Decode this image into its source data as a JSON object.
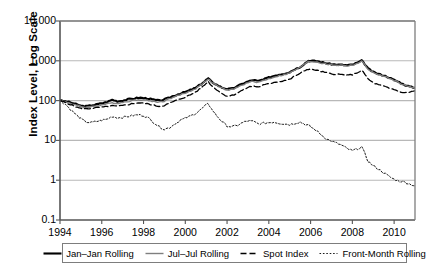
{
  "chart_data": {
    "type": "line",
    "title": "",
    "xlabel": "",
    "ylabel": "Index Level, Log Scale",
    "yscale": "log",
    "ylim": [
      0.1,
      10000
    ],
    "xlim": [
      1994,
      2011
    ],
    "grid": true,
    "legend_position": "bottom",
    "ytick_labels": [
      "10,000",
      "1,000",
      "100",
      "10",
      "1",
      "0.1"
    ],
    "ytick_values": [
      10000,
      1000,
      100,
      10,
      1,
      0.1
    ],
    "xtick_labels": [
      "1994",
      "1996",
      "1998",
      "2000",
      "2002",
      "2004",
      "2006",
      "2008",
      "2010"
    ],
    "xtick_values": [
      1994,
      1996,
      1998,
      2000,
      2002,
      2004,
      2006,
      2008,
      2010
    ],
    "series": [
      {
        "name": "Jan-Jan Rolling",
        "legend_label": "Jan–Jan Rolling",
        "style": "solid",
        "color": "#000000",
        "width": 2.1,
        "x": [
          1994.0,
          1994.25,
          1994.5,
          1994.75,
          1995.0,
          1995.25,
          1995.5,
          1995.75,
          1996.0,
          1996.25,
          1996.5,
          1996.75,
          1997.0,
          1997.25,
          1997.5,
          1997.75,
          1998.0,
          1998.25,
          1998.5,
          1998.75,
          1999.0,
          1999.25,
          1999.5,
          1999.75,
          2000.0,
          2000.25,
          2000.5,
          2000.75,
          2001.0,
          2001.1,
          2001.25,
          2001.5,
          2001.75,
          2002.0,
          2002.25,
          2002.5,
          2002.75,
          2003.0,
          2003.25,
          2003.5,
          2003.75,
          2004.0,
          2004.25,
          2004.5,
          2004.75,
          2005.0,
          2005.25,
          2005.5,
          2005.75,
          2005.9,
          2006.0,
          2006.25,
          2006.5,
          2006.75,
          2007.0,
          2007.25,
          2007.5,
          2007.75,
          2008.0,
          2008.25,
          2008.45,
          2008.6,
          2008.75,
          2009.0,
          2009.25,
          2009.5,
          2009.75,
          2010.0,
          2010.25,
          2010.5,
          2010.75,
          2011.0
        ],
        "y": [
          100,
          96,
          90,
          82,
          74,
          72,
          76,
          80,
          86,
          92,
          105,
          96,
          100,
          108,
          112,
          118,
          116,
          112,
          105,
          100,
          106,
          120,
          135,
          150,
          165,
          185,
          210,
          260,
          330,
          360,
          300,
          250,
          215,
          195,
          200,
          230,
          270,
          300,
          330,
          310,
          340,
          380,
          420,
          450,
          480,
          520,
          620,
          700,
          880,
          1000,
          990,
          990,
          930,
          870,
          820,
          800,
          790,
          770,
          800,
          900,
          1010,
          820,
          640,
          520,
          470,
          430,
          380,
          330,
          290,
          250,
          225,
          210
        ]
      },
      {
        "name": "Jul-Jul Rolling",
        "legend_label": "Jul–Jul Rolling",
        "style": "solid",
        "color": "#7f7f7f",
        "width": 1.4,
        "x": [
          1994.0,
          1994.25,
          1994.5,
          1994.75,
          1995.0,
          1995.25,
          1995.5,
          1995.75,
          1996.0,
          1996.25,
          1996.5,
          1996.75,
          1997.0,
          1997.25,
          1997.5,
          1997.75,
          1998.0,
          1998.25,
          1998.5,
          1998.75,
          1999.0,
          1999.25,
          1999.5,
          1999.75,
          2000.0,
          2000.25,
          2000.5,
          2000.75,
          2001.0,
          2001.1,
          2001.25,
          2001.5,
          2001.75,
          2002.0,
          2002.25,
          2002.5,
          2002.75,
          2003.0,
          2003.25,
          2003.5,
          2003.75,
          2004.0,
          2004.25,
          2004.5,
          2004.75,
          2005.0,
          2005.25,
          2005.5,
          2005.75,
          2005.9,
          2006.0,
          2006.25,
          2006.5,
          2006.75,
          2007.0,
          2007.25,
          2007.5,
          2007.75,
          2008.0,
          2008.25,
          2008.45,
          2008.6,
          2008.75,
          2009.0,
          2009.25,
          2009.5,
          2009.75,
          2010.0,
          2010.25,
          2010.5,
          2010.75,
          2011.0
        ],
        "y": [
          100,
          94,
          86,
          78,
          70,
          68,
          70,
          74,
          78,
          82,
          88,
          86,
          90,
          96,
          100,
          106,
          104,
          100,
          95,
          92,
          98,
          112,
          126,
          140,
          155,
          175,
          200,
          250,
          320,
          350,
          290,
          240,
          205,
          185,
          190,
          215,
          250,
          280,
          305,
          290,
          320,
          355,
          390,
          420,
          450,
          490,
          590,
          680,
          860,
          980,
          950,
          950,
          880,
          830,
          790,
          780,
          770,
          750,
          780,
          870,
          970,
          790,
          620,
          500,
          450,
          410,
          365,
          320,
          280,
          245,
          220,
          205
        ]
      },
      {
        "name": "Spot Index",
        "legend_label": "Spot Index",
        "style": "dashed",
        "color": "#000000",
        "width": 1.3,
        "dash": "6,3",
        "x": [
          1994.0,
          1994.25,
          1994.5,
          1994.75,
          1995.0,
          1995.25,
          1995.5,
          1995.75,
          1996.0,
          1996.25,
          1996.5,
          1996.75,
          1997.0,
          1997.25,
          1997.5,
          1997.75,
          1998.0,
          1998.25,
          1998.5,
          1998.75,
          1999.0,
          1999.25,
          1999.5,
          1999.75,
          2000.0,
          2000.25,
          2000.5,
          2000.75,
          2001.0,
          2001.1,
          2001.25,
          2001.5,
          2001.75,
          2002.0,
          2002.25,
          2002.5,
          2002.75,
          2003.0,
          2003.25,
          2003.5,
          2003.75,
          2004.0,
          2004.25,
          2004.5,
          2004.75,
          2005.0,
          2005.25,
          2005.5,
          2005.75,
          2005.9,
          2006.0,
          2006.25,
          2006.5,
          2006.75,
          2007.0,
          2007.25,
          2007.5,
          2007.75,
          2008.0,
          2008.25,
          2008.45,
          2008.6,
          2008.75,
          2009.0,
          2009.25,
          2009.5,
          2009.75,
          2010.0,
          2010.25,
          2010.5,
          2010.75,
          2011.0
        ],
        "y": [
          100,
          90,
          80,
          70,
          63,
          62,
          64,
          66,
          68,
          70,
          74,
          72,
          75,
          80,
          84,
          88,
          86,
          82,
          76,
          72,
          76,
          86,
          98,
          110,
          122,
          140,
          165,
          205,
          270,
          300,
          240,
          190,
          150,
          130,
          135,
          155,
          185,
          215,
          235,
          220,
          245,
          265,
          290,
          300,
          320,
          340,
          420,
          480,
          580,
          620,
          600,
          590,
          540,
          500,
          470,
          460,
          450,
          430,
          450,
          510,
          570,
          460,
          350,
          280,
          250,
          230,
          205,
          190,
          170,
          155,
          165,
          175
        ]
      },
      {
        "name": "Front-Month Rolling",
        "legend_label": "Front-Month Rolling",
        "style": "dotted",
        "color": "#000000",
        "width": 0.9,
        "dash": "1.6,1.8",
        "x": [
          1994.0,
          1994.25,
          1994.5,
          1994.75,
          1995.0,
          1995.25,
          1995.5,
          1995.75,
          1996.0,
          1996.25,
          1996.5,
          1996.75,
          1997.0,
          1997.25,
          1997.5,
          1997.75,
          1998.0,
          1998.25,
          1998.5,
          1998.75,
          1999.0,
          1999.25,
          1999.5,
          1999.75,
          2000.0,
          2000.25,
          2000.5,
          2000.75,
          2001.0,
          2001.1,
          2001.25,
          2001.5,
          2001.75,
          2002.0,
          2002.25,
          2002.5,
          2002.75,
          2003.0,
          2003.25,
          2003.5,
          2003.75,
          2004.0,
          2004.25,
          2004.5,
          2004.75,
          2005.0,
          2005.25,
          2005.5,
          2005.75,
          2005.9,
          2006.0,
          2006.25,
          2006.5,
          2006.75,
          2007.0,
          2007.25,
          2007.5,
          2007.75,
          2008.0,
          2008.25,
          2008.45,
          2008.6,
          2008.75,
          2009.0,
          2009.25,
          2009.5,
          2009.75,
          2010.0,
          2010.25,
          2010.5,
          2010.75,
          2011.0
        ],
        "y": [
          100,
          82,
          60,
          45,
          35,
          29,
          28,
          30,
          32,
          34,
          40,
          37,
          38,
          40,
          42,
          44,
          42,
          36,
          28,
          22,
          19,
          21,
          26,
          32,
          36,
          41,
          48,
          60,
          78,
          85,
          62,
          42,
          30,
          23,
          22,
          24,
          28,
          31,
          30,
          26,
          27,
          28,
          29,
          27,
          26,
          25,
          27,
          29,
          25,
          24,
          22,
          18,
          14,
          11,
          9.5,
          8.5,
          7.5,
          6.2,
          5.5,
          6.2,
          6.9,
          4.6,
          3.0,
          2.3,
          1.9,
          1.55,
          1.25,
          1.05,
          0.95,
          0.9,
          0.8,
          0.72
        ]
      }
    ]
  },
  "axes_geometry": {
    "left": 60,
    "right": 415,
    "top": 21,
    "bottom": 220
  },
  "legend": {
    "items": [
      "Jan–Jan Rolling",
      "Jul–Jul Rolling",
      "Spot Index",
      "Front-Month Rolling"
    ]
  },
  "colors": {
    "axis": "#555555",
    "grid": "#b8b8b8",
    "frame": "#7d7d7d",
    "series_black": "#000000",
    "series_gray": "#7f7f7f"
  }
}
